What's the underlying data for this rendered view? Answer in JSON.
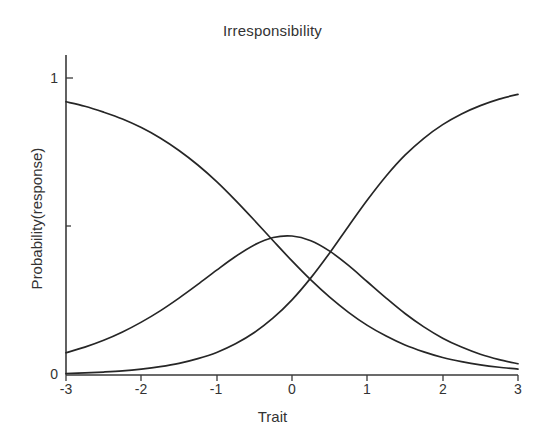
{
  "chart_data": {
    "type": "line",
    "title": "Irresponsibility",
    "xlabel": "Trait",
    "ylabel": "Probability(response)",
    "xlim": [
      -3,
      3
    ],
    "ylim": [
      0,
      1
    ],
    "grid": false,
    "legend": "none",
    "x_ticks": [
      "-3",
      "-2",
      "-1",
      "0",
      "1",
      "2",
      "3"
    ],
    "x_tick_values": [
      -3,
      -2,
      -1,
      0,
      1,
      2,
      3
    ],
    "y_ticks": [
      "0",
      "1"
    ],
    "y_tick_values": [
      0,
      1
    ],
    "x": [
      -3,
      -2.75,
      -2.5,
      -2.25,
      -2,
      -1.75,
      -1.5,
      -1.25,
      -1,
      -0.75,
      -0.5,
      -0.25,
      0,
      0.25,
      0.5,
      0.75,
      1,
      1.25,
      1.5,
      1.75,
      2,
      2.25,
      2.5,
      2.75,
      3
    ],
    "series": [
      {
        "name": "Category 1 (decreasing)",
        "values": [
          0.92,
          0.905,
          0.885,
          0.862,
          0.833,
          0.798,
          0.756,
          0.707,
          0.651,
          0.588,
          0.521,
          0.452,
          0.384,
          0.32,
          0.262,
          0.211,
          0.167,
          0.131,
          0.101,
          0.078,
          0.059,
          0.045,
          0.034,
          0.026,
          0.02
        ]
      },
      {
        "name": "Category 2 (bell / middle)",
        "values": [
          0.075,
          0.094,
          0.117,
          0.145,
          0.178,
          0.216,
          0.259,
          0.305,
          0.353,
          0.399,
          0.438,
          0.463,
          0.468,
          0.452,
          0.417,
          0.369,
          0.314,
          0.259,
          0.207,
          0.162,
          0.124,
          0.094,
          0.07,
          0.052,
          0.038
        ]
      },
      {
        "name": "Category 3 (increasing)",
        "values": [
          0.005,
          0.007,
          0.01,
          0.014,
          0.02,
          0.028,
          0.039,
          0.055,
          0.076,
          0.105,
          0.143,
          0.192,
          0.253,
          0.327,
          0.411,
          0.501,
          0.589,
          0.67,
          0.74,
          0.797,
          0.843,
          0.879,
          0.907,
          0.929,
          0.945
        ]
      }
    ],
    "annotations": {
      "peak_of_middle_curve": {
        "x": -0.36,
        "y": 0.47
      },
      "crossing_low_mid": {
        "x": -0.97,
        "y": 0.36
      },
      "crossing_mid_high": {
        "x": 0.28,
        "y": 0.33
      }
    },
    "colors": {
      "curve": "#262626",
      "axis": "#3a3a3a",
      "text": "#333333",
      "background": "#ffffff"
    }
  },
  "axis_titles": {
    "x": "Trait",
    "y": "Probability(response)"
  }
}
